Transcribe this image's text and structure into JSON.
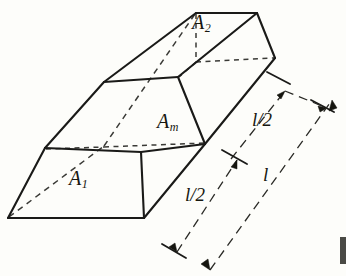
{
  "figure": {
    "kind": "geometry-diagram",
    "background_color": "#fdfdfa",
    "ink_color": "#1a1a18",
    "labels": {
      "area_top": "A",
      "area_top_sub": "2",
      "area_mid": "A",
      "area_mid_sub": "m",
      "area_bottom": "A",
      "area_bottom_sub": "1",
      "length_half_upper": "l/2",
      "length_half_lower": "l/2",
      "length_full": "l"
    },
    "geometry": {
      "solid_edges": [
        "M 8,218 L 45,148",
        "M 45,148 L 104,82",
        "M 104,82 L 196,13",
        "M 196,13 L 257,13",
        "M 257,13 L 275,58",
        "M 275,58 L 205,144",
        "M 205,144 L 144,218",
        "M 144,218 L 8,218",
        "M 45,148 L 141,152",
        "M 141,152 L 205,144",
        "M 104,82 L 178,77",
        "M 178,77 L 205,144",
        "M 178,77 L 257,13",
        "M 141,152 L 144,218"
      ],
      "hidden_edges": [
        "M 8,218 L 105,146",
        "M 105,146 L 196,13",
        "M 105,146 L 45,148",
        "M 105,146 L 141,152",
        "M 141,152 L 205,144",
        "M 196,13 L 196,62",
        "M 196,62 L 275,58",
        "M 196,62 L 178,77"
      ],
      "dimension_lines": [
        {
          "name": "upper-half",
          "from": [
            266,
            75
          ],
          "to": [
            323,
            105
          ],
          "label": "l/2"
        },
        {
          "name": "lower-half",
          "from": [
            176,
            254
          ],
          "to": [
            240,
            157
          ],
          "label": "l/2"
        },
        {
          "name": "full-length",
          "from": [
            213,
            272
          ],
          "to": [
            333,
            99
          ],
          "label": "l"
        }
      ]
    }
  }
}
